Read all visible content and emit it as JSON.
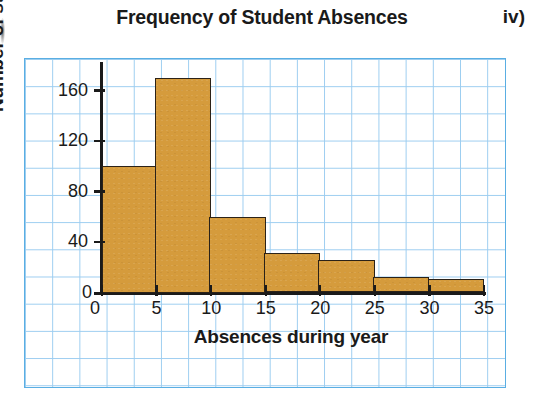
{
  "figure_label": "iv)",
  "chart_data": {
    "type": "bar",
    "title": "Frequency of Student Absences",
    "xlabel": "Absences during year",
    "ylabel": "Number of students",
    "grid": true,
    "legend": "none",
    "xlim": [
      0,
      35
    ],
    "ylim": [
      0,
      180
    ],
    "x_ticks": [
      "0",
      "5",
      "10",
      "15",
      "20",
      "25",
      "30",
      "35"
    ],
    "x_tick_values": [
      0,
      5,
      10,
      15,
      20,
      25,
      30,
      35
    ],
    "y_ticks": [
      "0",
      "40",
      "80",
      "120",
      "160"
    ],
    "y_tick_values": [
      0,
      40,
      80,
      120,
      160
    ],
    "bin_width": 5,
    "bins": [
      {
        "range": "0-5",
        "start": 0,
        "end": 5,
        "value": 100
      },
      {
        "range": "5-10",
        "start": 5,
        "end": 10,
        "value": 170
      },
      {
        "range": "10-15",
        "start": 10,
        "end": 15,
        "value": 60
      },
      {
        "range": "15-20",
        "start": 15,
        "end": 20,
        "value": 31
      },
      {
        "range": "20-25",
        "start": 20,
        "end": 25,
        "value": 26
      },
      {
        "range": "25-30",
        "start": 25,
        "end": 30,
        "value": 12
      },
      {
        "range": "30-35",
        "start": 30,
        "end": 35,
        "value": 11
      }
    ],
    "categories": [
      "0-5",
      "5-10",
      "10-15",
      "15-20",
      "20-25",
      "25-30",
      "30-35"
    ],
    "values": [
      100,
      170,
      60,
      31,
      26,
      12,
      11
    ],
    "colors": {
      "bar_fill": "#d59b3c",
      "bar_stroke": "#2b2218",
      "grid_line": "#9ccdf0",
      "grid_border": "#5aaee3",
      "axis": "#1a1a1a",
      "text": "#1a1a1a"
    }
  }
}
